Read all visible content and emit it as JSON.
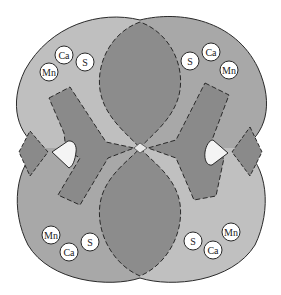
{
  "colors": {
    "background": "#ffffff",
    "lobe_light": "#bfbfbf",
    "lobe_medium": "#a8a8a8",
    "overlap_dark": "#8c8c8c",
    "bar_fill": "#8a8a8a",
    "hole_fill": "#f4f4f4",
    "ion_fill": "#ffffff",
    "outline": "#2a2a2a"
  },
  "ion_clusters": [
    {
      "position": "top-left",
      "ions": [
        {
          "label": "Ca",
          "cx": 64,
          "cy": 55
        },
        {
          "label": "Mn",
          "cx": 49,
          "cy": 72
        },
        {
          "label": "S",
          "cx": 85,
          "cy": 62
        }
      ]
    },
    {
      "position": "top-right",
      "ions": [
        {
          "label": "S",
          "cx": 190,
          "cy": 61
        },
        {
          "label": "Ca",
          "cx": 211,
          "cy": 52
        },
        {
          "label": "Mn",
          "cx": 229,
          "cy": 70
        }
      ]
    },
    {
      "position": "bottom-left",
      "ions": [
        {
          "label": "Mn",
          "cx": 51,
          "cy": 235
        },
        {
          "label": "Ca",
          "cx": 69,
          "cy": 252
        },
        {
          "label": "S",
          "cx": 90,
          "cy": 242
        }
      ]
    },
    {
      "position": "bottom-right",
      "ions": [
        {
          "label": "Mn",
          "cx": 231,
          "cy": 232
        },
        {
          "label": "S",
          "cx": 193,
          "cy": 241
        },
        {
          "label": "Ca",
          "cx": 213,
          "cy": 250
        }
      ]
    }
  ]
}
